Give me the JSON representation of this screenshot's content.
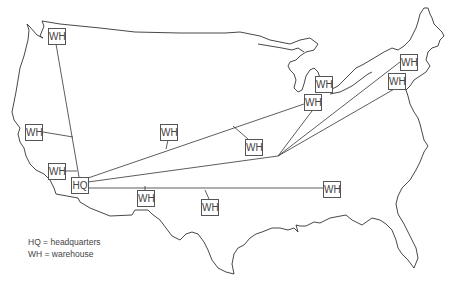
{
  "diagram": {
    "type": "distribution-network-map",
    "region": "United States (contiguous)",
    "hq": {
      "label": "HQ",
      "x": 71,
      "y": 177
    },
    "hub": {
      "x": 278,
      "y": 156
    },
    "warehouses": [
      {
        "label": "WH",
        "x": 48,
        "y": 28
      },
      {
        "label": "WH",
        "x": 25,
        "y": 124
      },
      {
        "label": "WH",
        "x": 48,
        "y": 163
      },
      {
        "label": "WH",
        "x": 160,
        "y": 124
      },
      {
        "label": "WH",
        "x": 245,
        "y": 139
      },
      {
        "label": "WH",
        "x": 304,
        "y": 94
      },
      {
        "label": "WH",
        "x": 315,
        "y": 76
      },
      {
        "label": "WH",
        "x": 400,
        "y": 54
      },
      {
        "label": "WH",
        "x": 388,
        "y": 73
      },
      {
        "label": "WH",
        "x": 137,
        "y": 190
      },
      {
        "label": "WH",
        "x": 201,
        "y": 199
      },
      {
        "label": "WH",
        "x": 323,
        "y": 181
      }
    ],
    "legend": [
      "HQ = headquarters",
      "WH = warehouse"
    ]
  }
}
